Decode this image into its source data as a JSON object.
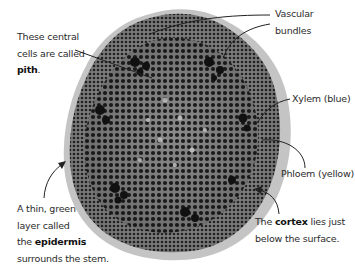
{
  "diagram": {
    "colors": {
      "background": "#ffffff",
      "text": "#2b2b2b",
      "leader_line": "#222222",
      "outer_cortex": "#bdbdbd",
      "tissue_dark": "#3a3a3a",
      "tissue_mid": "#6e6e6e"
    },
    "labels": {
      "pith": {
        "lines": [
          "These central",
          "cells are called"
        ],
        "term": "pith",
        "suffix": "."
      },
      "vascular": {
        "lines": [
          "Vascular",
          "bundles"
        ]
      },
      "xylem": {
        "text": "Xylem (blue)"
      },
      "phloem": {
        "text": "Phloem (yellow)"
      },
      "epidermis": {
        "lines": [
          "A thin, green",
          "layer called"
        ],
        "prefix": "the ",
        "term": "epidermis",
        "last_line": "surrounds the stem."
      },
      "cortex": {
        "prefix": "The ",
        "term": "cortex",
        "suffix": " lies just",
        "last_line": "below the surface."
      }
    }
  }
}
